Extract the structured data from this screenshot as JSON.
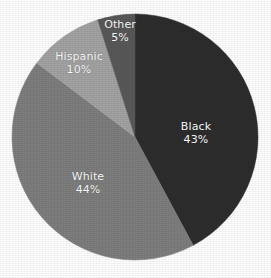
{
  "chart_data": {
    "type": "pie",
    "title": "",
    "xlabel": "",
    "ylabel": "",
    "legend": "none",
    "grid": false,
    "start_angle_deg": 0,
    "direction": "clockwise",
    "categories": [
      "Black",
      "White",
      "Hispanic",
      "Other"
    ],
    "values": [
      43,
      44,
      10,
      5
    ],
    "value_suffix": "%",
    "slices": [
      {
        "label": "Black",
        "value": 43,
        "value_text": "43%",
        "color": "#2d2d2d",
        "label_color": "#ffffff",
        "label_x": 196,
        "label_y": 133
      },
      {
        "label": "White",
        "value": 44,
        "value_text": "44%",
        "color": "#7e7e7e",
        "label_color": "#ffffff",
        "label_x": 88,
        "label_y": 183
      },
      {
        "label": "Hispanic",
        "value": 10,
        "value_text": "10%",
        "color": "#a3a3a3",
        "label_color": "#ffffff",
        "label_x": 79,
        "label_y": 63
      },
      {
        "label": "Other",
        "value": 5,
        "value_text": "5%",
        "color": "#595959",
        "label_color": "#ffffff",
        "label_x": 120,
        "label_y": 31
      }
    ],
    "geometry": {
      "center_x": 135,
      "center_y": 137,
      "radius": 123
    },
    "background_color": "#ffffff"
  }
}
